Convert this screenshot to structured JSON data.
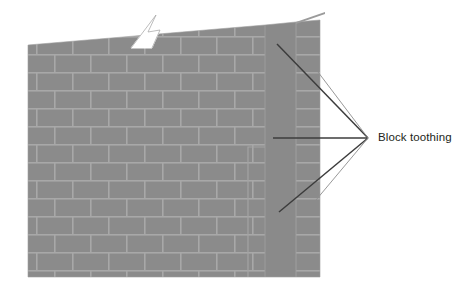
{
  "figure": {
    "kind": "construction-detail-diagram",
    "background_color": "#ffffff"
  },
  "annotation": {
    "label": "Block toothing",
    "label_color": "#231f20",
    "leader_color": "#3c3c3c",
    "leader_line_color": "#808080",
    "label_x": 378,
    "label_y": 133,
    "leader_apex_x": 368,
    "leader_apex_y": 138,
    "leaders": [
      {
        "name": "leader-top",
        "x1": 277,
        "y1": 44,
        "x2": 368,
        "y2": 138
      },
      {
        "name": "leader-middle",
        "x1": 273,
        "y1": 138,
        "x2": 368,
        "y2": 138
      },
      {
        "name": "leader-bottom",
        "x1": 279,
        "y1": 212,
        "x2": 368,
        "y2": 138
      }
    ]
  },
  "wall": {
    "face_color": "#8b8b8b",
    "mortar_color": "#a8a8a8",
    "return_color": "#8a8a8a",
    "edge_color": "#9a9a9a",
    "left_x": 28,
    "right_x": 320,
    "bottom_y": 277,
    "top_left_y": 45,
    "top_right_y": 20,
    "courses": 13,
    "course_height": 18,
    "bond": "running bond",
    "block_width": 36,
    "toothing_step_x": 248,
    "toothing_step_y": 147,
    "return_wall_left_x": 265,
    "return_wall_right_x": 296,
    "right_column_left_x": 296,
    "right_column_right_x": 320,
    "sliver_tip_x": 325,
    "sliver_tip_y": 12
  },
  "break_symbol": {
    "name": "break-line",
    "color": "#ffffff",
    "outline_color": "#9a9a9a",
    "x": 130,
    "y": 14,
    "width": 46,
    "height": 34
  }
}
